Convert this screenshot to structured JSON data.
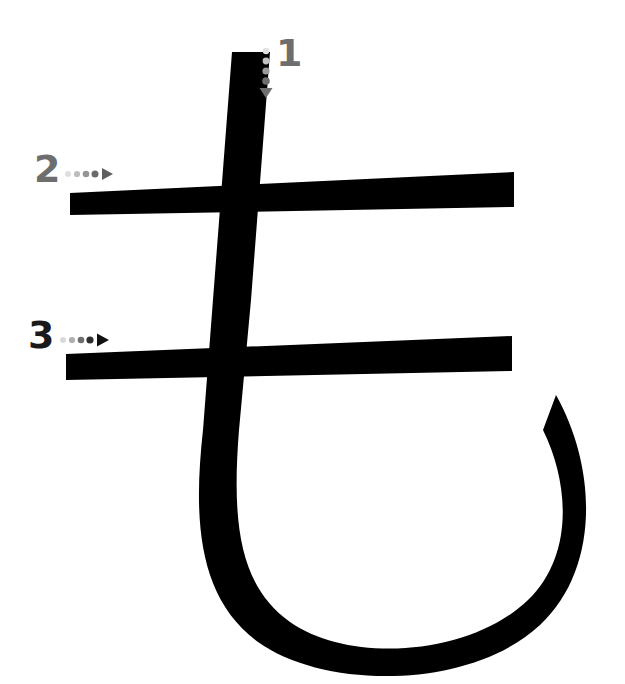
{
  "canvas": {
    "width": 625,
    "height": 684,
    "background": "#ffffff"
  },
  "character": {
    "glyph": "も",
    "script": "hiragana",
    "romaji": "mo",
    "stroke_count": 3,
    "ink_color": "#000000"
  },
  "stroke_markers": [
    {
      "number": "1",
      "color": "#6e6e6e",
      "direction": "down",
      "dots": 4,
      "dot_colors": [
        "#e0e0e0",
        "#c2c2c2",
        "#9a9a9a",
        "#6e6e6e"
      ],
      "arrowhead_color": "#6e6e6e"
    },
    {
      "number": "2",
      "color": "#6e6e6e",
      "direction": "right",
      "dots": 4,
      "dot_colors": [
        "#dedede",
        "#bdbdbd",
        "#959595",
        "#6a6a6a"
      ],
      "arrowhead_color": "#5f5f5f"
    },
    {
      "number": "3",
      "color": "#1a1a1a",
      "direction": "right",
      "dots": 4,
      "dot_colors": [
        "#d8d8d8",
        "#b0b0b0",
        "#6f6f6f",
        "#2e2e2e"
      ],
      "arrowhead_color": "#111111"
    }
  ],
  "strokes": [
    {
      "id": "stroke-1-vertical",
      "label": "vertical descending stroke",
      "order": 1
    },
    {
      "id": "stroke-2-upper-horizontal",
      "label": "upper horizontal stroke",
      "order": 2
    },
    {
      "id": "stroke-3-lower-horizontal",
      "label": "lower horizontal stroke",
      "order": 3
    }
  ]
}
